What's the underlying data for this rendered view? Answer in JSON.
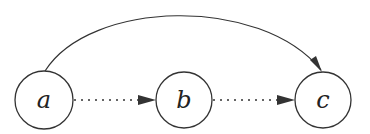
{
  "diagram": {
    "nodes": [
      {
        "id": "a",
        "label": "a",
        "cx": 44,
        "cy": 100,
        "r": 29
      },
      {
        "id": "b",
        "label": "b",
        "cx": 184,
        "cy": 100,
        "r": 28
      },
      {
        "id": "c",
        "label": "c",
        "cx": 323,
        "cy": 100,
        "r": 28
      }
    ],
    "edges": [
      {
        "from": "a",
        "to": "b",
        "style": "dotted"
      },
      {
        "from": "b",
        "to": "c",
        "style": "dotted"
      },
      {
        "from": "a",
        "to": "c",
        "style": "solid-arc"
      }
    ],
    "colors": {
      "stroke": "#333333",
      "background": "#ffffff"
    }
  }
}
